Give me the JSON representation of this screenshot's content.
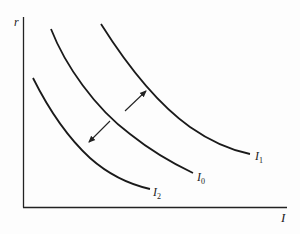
{
  "diagram": {
    "type": "economics-curve-shift",
    "axes": {
      "y_label": "r",
      "x_label": "I"
    },
    "curves": [
      {
        "id": "I1",
        "label_main": "I",
        "label_sub": "1",
        "description": "shifted out curve"
      },
      {
        "id": "I0",
        "label_main": "I",
        "label_sub": "0",
        "description": "original curve"
      },
      {
        "id": "I2",
        "label_main": "I",
        "label_sub": "2",
        "description": "shifted in curve"
      }
    ],
    "arrows": [
      {
        "from": "I0",
        "to": "I1",
        "direction": "outward"
      },
      {
        "from": "I0",
        "to": "I2",
        "direction": "inward"
      }
    ]
  }
}
